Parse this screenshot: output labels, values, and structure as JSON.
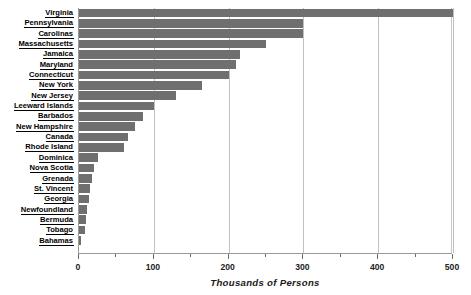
{
  "chart_data": {
    "type": "bar",
    "orientation": "horizontal",
    "title": "",
    "xlabel": "Thousands of Persons",
    "ylabel": "",
    "xlim": [
      0,
      500
    ],
    "xticks": [
      0,
      100,
      200,
      300,
      400,
      500
    ],
    "xminorticks": [
      50,
      150,
      250,
      350,
      450
    ],
    "grid": true,
    "legend": null,
    "bar_color": "#6f6f6f",
    "categories": [
      "Virginia",
      "Pennsylvania",
      "Carolinas",
      "Massachusetts",
      "Jamaica",
      "Maryland",
      "Connecticut",
      "New York",
      "New Jersey",
      "Leeward Islands",
      "Barbados",
      "New Hampshire",
      "Canada",
      "Rhode Island",
      "Dominica",
      "Nova Scotia",
      "Grenada",
      "St. Vincent",
      "Georgia",
      "Newfoundland",
      "Bermuda",
      "Tobago",
      "Bahamas"
    ],
    "values": [
      500,
      300,
      300,
      250,
      215,
      210,
      200,
      165,
      130,
      100,
      85,
      75,
      65,
      60,
      25,
      20,
      18,
      15,
      13,
      11,
      9,
      8,
      3
    ]
  },
  "axis": {
    "x_title": "Thousands of Persons",
    "tick_labels": [
      "0",
      "100",
      "200",
      "300",
      "400",
      "500"
    ]
  }
}
